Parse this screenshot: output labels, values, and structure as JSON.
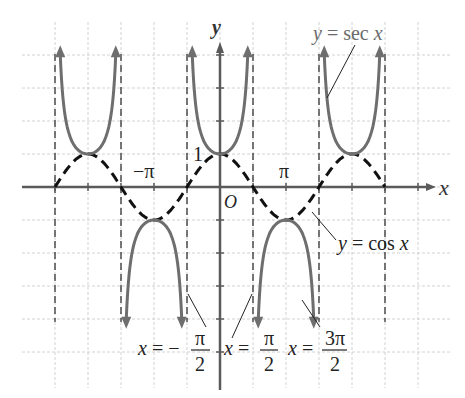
{
  "chart_data": {
    "type": "line",
    "title": "",
    "xlabel": "x",
    "ylabel": "y",
    "origin_label": "O",
    "xlim": [
      -7.069,
      6.283
    ],
    "ylim": [
      -6,
      4.1
    ],
    "grid": true,
    "grid_step_x": "π/2",
    "grid_step_y": 1,
    "x_tick_labels": [
      {
        "value": -3.14159,
        "label": "−π"
      },
      {
        "value": 3.14159,
        "label": "π"
      }
    ],
    "y_tick_labels": [
      {
        "value": 1,
        "label": "1"
      }
    ],
    "series": [
      {
        "name": "y = sec x",
        "style": "solid",
        "color": "#6e6e6e",
        "function": "sec(x)",
        "x_range": [
          -7.85,
          7.85
        ]
      },
      {
        "name": "y = cos x",
        "style": "dashed",
        "color": "#111111",
        "function": "cos(x)",
        "x_range": [
          -7.85,
          7.85
        ]
      }
    ],
    "asymptotes": [
      {
        "x": -7.854,
        "label": ""
      },
      {
        "x": -4.712,
        "label": ""
      },
      {
        "x": -1.5708,
        "label": "x = −π/2"
      },
      {
        "x": 1.5708,
        "label": "x = π/2"
      },
      {
        "x": 4.712,
        "label": "x = 3π/2"
      },
      {
        "x": 7.854,
        "label": ""
      }
    ],
    "annotations": [
      {
        "text": "y = sec x",
        "points_to": "sec branch near x = 3π/2"
      },
      {
        "text": "y = cos x",
        "points_to": "cos curve near x = 3π/2"
      }
    ]
  },
  "labels": {
    "x_axis": "x",
    "y_axis": "y",
    "origin": "O",
    "one": "1",
    "neg_pi": "−π",
    "pi": "π",
    "sec_label": "y = sec x",
    "cos_label": "y = cos x",
    "asym1": {
      "lhs": "x = −",
      "num": "π",
      "den": "2"
    },
    "asym2": {
      "lhs": "x = ",
      "num": "π",
      "den": "2"
    },
    "asym3": {
      "lhs": "x = ",
      "num": "3π",
      "den": "2"
    }
  },
  "colors": {
    "sec": "#6e6e6e",
    "cos": "#111111",
    "grid": "#d2d2d2",
    "axis": "#5a5a5a",
    "asymptote": "#333333"
  }
}
